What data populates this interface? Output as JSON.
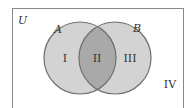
{
  "diagram": {
    "type": "venn",
    "universe_label": "U",
    "sets": [
      {
        "label": "A",
        "region_label": "I"
      },
      {
        "label": "B",
        "region_label": "III"
      }
    ],
    "intersection_label": "II",
    "outside_label": "IV",
    "colors": {
      "circle_fill": "#d3d3d3",
      "intersection_fill": "#a9a9a9",
      "stroke": "#6f6f6f",
      "border": "#888888"
    }
  }
}
